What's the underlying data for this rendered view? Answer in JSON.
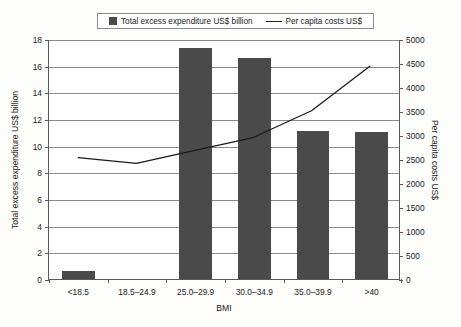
{
  "legend": {
    "entries": [
      {
        "label": "Total excess expenditure US$ billion",
        "marker": "bar-swatch-icon",
        "color": "#4a4a4a"
      },
      {
        "label": "Per capita costs US$",
        "marker": "line-swatch-icon",
        "color": "#1a1a1a"
      }
    ]
  },
  "chart_data": {
    "type": "bar",
    "title": "",
    "subtitle": "",
    "xlabel": "BMI",
    "ylabel": "Total excess expenditure US$ billion",
    "y2label": "Per capita costs US$",
    "categories": [
      "<18.5",
      "18.5–24.9",
      "25.0–29.9",
      "30.0–34.9",
      "35.0–39.9",
      ">40"
    ],
    "series": [
      {
        "name": "Total excess expenditure US$ billion",
        "type": "bar",
        "axis": "left",
        "color": "#4a4a4a",
        "values": [
          0.6,
          0,
          17.3,
          16.6,
          11.1,
          11.0
        ]
      },
      {
        "name": "Per capita costs US$",
        "type": "line",
        "axis": "right",
        "color": "#1a1a1a",
        "values": [
          2540,
          2420,
          2690,
          2960,
          3520,
          4450
        ]
      }
    ],
    "ylim": [
      0,
      18
    ],
    "yticks": [
      0,
      2,
      4,
      6,
      8,
      10,
      12,
      14,
      16,
      18
    ],
    "yticklabels": [
      "0",
      "2",
      "4",
      "6",
      "8",
      "10",
      "12",
      "14",
      "16",
      "18"
    ],
    "y2lim": [
      0,
      5000
    ],
    "y2ticks": [
      0,
      500,
      1000,
      1500,
      2000,
      2500,
      3000,
      3500,
      4000,
      4500,
      5000
    ],
    "y2ticklabels": [
      "0",
      "500",
      "1000",
      "1500",
      "2000",
      "2500",
      "3000",
      "3500",
      "4000",
      "4500",
      "5000"
    ],
    "grid": true,
    "legend_position": "top-center"
  }
}
